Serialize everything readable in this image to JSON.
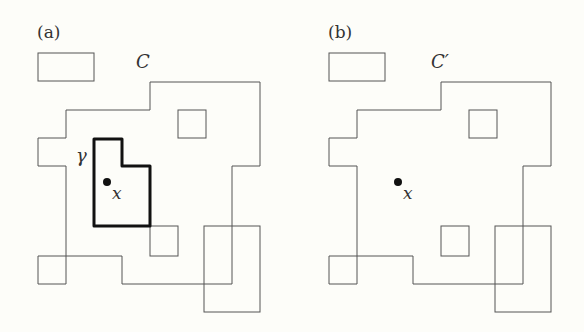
{
  "figure": {
    "panels": [
      {
        "id": "a",
        "label": "(a)",
        "set_label": "C",
        "contour_label": "γ",
        "point_label": "x",
        "has_contour": true
      },
      {
        "id": "b",
        "label": "(b)",
        "set_label": "C′",
        "point_label": "x",
        "has_contour": false
      }
    ],
    "colors": {
      "background": "#fdfdf9",
      "thin_stroke": "#555555",
      "contour_stroke": "#111111",
      "point_fill": "#111111"
    }
  }
}
